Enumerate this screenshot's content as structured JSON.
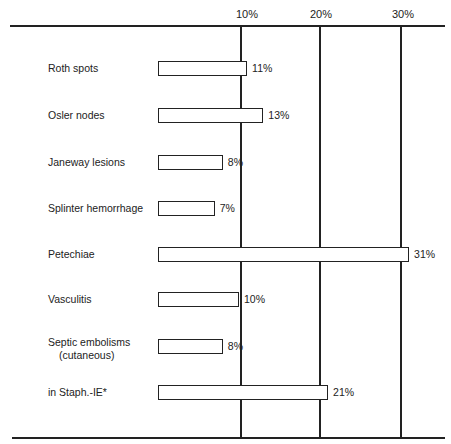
{
  "chart_data": {
    "type": "bar",
    "orientation": "horizontal",
    "title": "",
    "xlabel": "",
    "ylabel": "",
    "xlim": [
      0,
      32
    ],
    "grid": true,
    "tick_labels": [
      "10%",
      "20%",
      "30%"
    ],
    "ticks": [
      10,
      20,
      30
    ],
    "categories": [
      "Roth spots",
      "Osler nodes",
      "Janeway lesions",
      "Splinter hemorrhage",
      "Petechiae",
      "Vasculitis",
      "Septic embolisms\n(cutaneous)",
      "in Staph.-IE*"
    ],
    "values": [
      11,
      13,
      8,
      7,
      31,
      10,
      8,
      21
    ],
    "value_labels": [
      "11%",
      "13%",
      "8%",
      "7%",
      "31%",
      "10%",
      "8%",
      "21%"
    ]
  }
}
